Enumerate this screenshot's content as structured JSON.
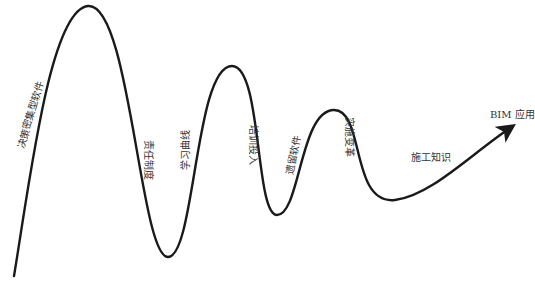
{
  "diagram": {
    "type": "wave-curve-with-arrow",
    "colors": {
      "line": "#1a1a1a",
      "text": "#333333",
      "background": "#ffffff"
    },
    "labels": [
      {
        "id": "decision-intensive-software",
        "text": "决策密集型软件"
      },
      {
        "id": "responsibility-system",
        "text": "责任制度"
      },
      {
        "id": "learning-curve",
        "text": "学习曲线"
      },
      {
        "id": "training-investment",
        "text": "培训投入"
      },
      {
        "id": "legacy-software",
        "text": "遗留软件"
      },
      {
        "id": "implementation-change",
        "text": "实施变革"
      },
      {
        "id": "construction-knowledge",
        "text": "施工知识"
      },
      {
        "id": "bim-application",
        "text": "BIM 应用"
      }
    ]
  }
}
